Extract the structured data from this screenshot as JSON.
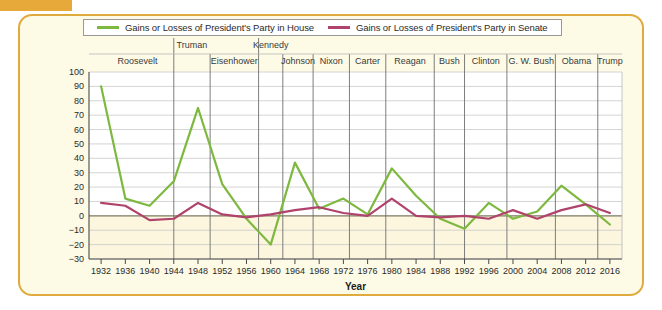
{
  "legend": {
    "entries": [
      {
        "label": "Gains or Losses of President's Party in House",
        "color": "#7db83f",
        "icon": "line-swatch-green"
      },
      {
        "label": "Gains or Losses of President's Party in Senate",
        "color": "#b0436b",
        "icon": "line-swatch-maroon"
      }
    ]
  },
  "axes": {
    "xlabel": "Year",
    "yticks": [
      100,
      90,
      80,
      70,
      60,
      50,
      40,
      30,
      20,
      10,
      0,
      -10,
      -20,
      -30
    ],
    "ytick_labels": [
      "100",
      "90",
      "80",
      "70",
      "60",
      "50",
      "40",
      "30",
      "20",
      "10",
      "0",
      "−10",
      "−20",
      "−30"
    ]
  },
  "presidents": [
    {
      "name": "Roosevelt",
      "start_year": 1932,
      "end_year": 1944,
      "label_row": 1
    },
    {
      "name": "Truman",
      "start_year": 1944,
      "end_year": 1950,
      "label_row": 0
    },
    {
      "name": "Eisenhower",
      "start_year": 1950,
      "end_year": 1958,
      "label_row": 1
    },
    {
      "name": "Kennedy",
      "start_year": 1958,
      "end_year": 1962,
      "label_row": 0
    },
    {
      "name": "Johnson",
      "start_year": 1962,
      "end_year": 1967,
      "label_row": 1
    },
    {
      "name": "Nixon",
      "start_year": 1967,
      "end_year": 1973,
      "label_row": 1
    },
    {
      "name": "Carter",
      "start_year": 1973,
      "end_year": 1979,
      "label_row": 1
    },
    {
      "name": "Reagan",
      "start_year": 1979,
      "end_year": 1987,
      "label_row": 1
    },
    {
      "name": "Bush",
      "start_year": 1987,
      "end_year": 1992,
      "label_row": 1
    },
    {
      "name": "Clinton",
      "start_year": 1992,
      "end_year": 1999,
      "label_row": 1
    },
    {
      "name": "G. W. Bush",
      "start_year": 1999,
      "end_year": 2007,
      "label_row": 1
    },
    {
      "name": "Obama",
      "start_year": 2007,
      "end_year": 2014,
      "label_row": 1
    },
    {
      "name": "Trump",
      "start_year": 2014,
      "end_year": 2018,
      "label_row": 1
    }
  ],
  "chart_data": {
    "type": "line",
    "title": "",
    "xlabel": "Year",
    "ylabel": "",
    "xlim": [
      1930,
      2018
    ],
    "ylim": [
      -30,
      100
    ],
    "grid": true,
    "legend_position": "top",
    "x": [
      1932,
      1936,
      1940,
      1944,
      1948,
      1952,
      1956,
      1960,
      1964,
      1968,
      1972,
      1976,
      1980,
      1984,
      1988,
      1992,
      1996,
      2000,
      2004,
      2008,
      2012,
      2016
    ],
    "categories": [
      "1932",
      "1936",
      "1940",
      "1944",
      "1948",
      "1952",
      "1956",
      "1960",
      "1964",
      "1968",
      "1972",
      "1976",
      "1980",
      "1984",
      "1988",
      "1992",
      "1996",
      "2000",
      "2004",
      "2008",
      "2012",
      "2016"
    ],
    "series": [
      {
        "name": "Gains or Losses of President's Party in House",
        "color": "#7db83f",
        "values": [
          90,
          12,
          7,
          24,
          75,
          22,
          -2,
          -20,
          37,
          5,
          12,
          1,
          33,
          14,
          -2,
          -9,
          9,
          -2,
          3,
          21,
          8,
          -6
        ]
      },
      {
        "name": "Gains or Losses of President's Party in Senate",
        "color": "#b0436b",
        "values": [
          9,
          7,
          -3,
          -2,
          9,
          1,
          -1,
          1,
          4,
          6,
          2,
          0,
          12,
          0,
          -1,
          0,
          -2,
          4,
          -2,
          4,
          8,
          2
        ]
      }
    ]
  }
}
